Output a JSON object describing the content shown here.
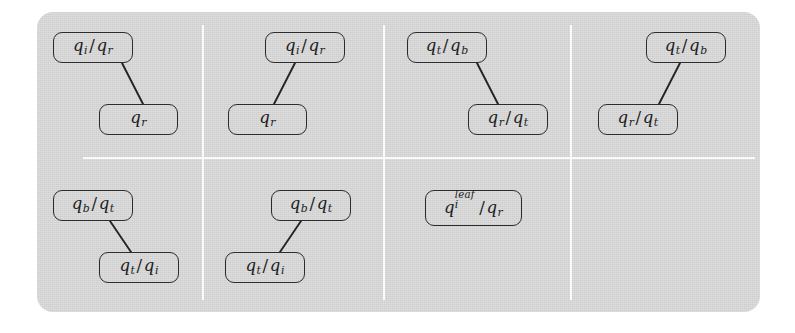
{
  "figure": {
    "panel": {
      "fill": "#d7d7d7",
      "divider_color": "#fbfbfb"
    },
    "page_background": "#ffffff",
    "ink_color": "#242424",
    "columns": 4,
    "rows": 2
  },
  "cells": [
    {
      "id": "cell-r1c1",
      "layout": "parent-left-child-right",
      "nodes": [
        {
          "id": "r1c1-parent",
          "label": "qi/qr",
          "role": "parent"
        },
        {
          "id": "r1c1-child",
          "label": "qr",
          "role": "child"
        }
      ],
      "edges": [
        {
          "from": "r1c1-parent",
          "to": "r1c1-child"
        }
      ]
    },
    {
      "id": "cell-r1c2",
      "layout": "parent-right-child-left",
      "nodes": [
        {
          "id": "r1c2-parent",
          "label": "qi/qr",
          "role": "parent"
        },
        {
          "id": "r1c2-child",
          "label": "qr",
          "role": "child"
        }
      ],
      "edges": [
        {
          "from": "r1c2-parent",
          "to": "r1c2-child"
        }
      ]
    },
    {
      "id": "cell-r1c3",
      "layout": "parent-left-child-right",
      "nodes": [
        {
          "id": "r1c3-parent",
          "label": "qt/qb",
          "role": "parent"
        },
        {
          "id": "r1c3-child",
          "label": "qr/qt",
          "role": "child"
        }
      ],
      "edges": [
        {
          "from": "r1c3-parent",
          "to": "r1c3-child"
        }
      ]
    },
    {
      "id": "cell-r1c4",
      "layout": "parent-right-child-left",
      "nodes": [
        {
          "id": "r1c4-parent",
          "label": "qt/qb",
          "role": "parent"
        },
        {
          "id": "r1c4-child",
          "label": "qr/qt",
          "role": "child"
        }
      ],
      "edges": [
        {
          "from": "r1c4-parent",
          "to": "r1c4-child"
        }
      ]
    },
    {
      "id": "cell-r2c1",
      "layout": "parent-left-child-right",
      "nodes": [
        {
          "id": "r2c1-parent",
          "label": "qb/qt",
          "role": "parent"
        },
        {
          "id": "r2c1-child",
          "label": "qt/qi",
          "role": "child"
        }
      ],
      "edges": [
        {
          "from": "r2c1-parent",
          "to": "r2c1-child"
        }
      ]
    },
    {
      "id": "cell-r2c2",
      "layout": "parent-right-child-left",
      "nodes": [
        {
          "id": "r2c2-parent",
          "label": "qb/qt",
          "role": "parent"
        },
        {
          "id": "r2c2-child",
          "label": "qt/qi",
          "role": "child"
        }
      ],
      "edges": [
        {
          "from": "r2c2-parent",
          "to": "r2c2-child"
        }
      ]
    },
    {
      "id": "cell-r2c3",
      "layout": "single-node",
      "nodes": [
        {
          "id": "r2c3-node",
          "label": "qi^leaf/qr",
          "role": "single"
        }
      ],
      "edges": []
    },
    {
      "id": "cell-r2c4",
      "layout": "empty",
      "nodes": [],
      "edges": []
    }
  ],
  "symbols": {
    "q": "q",
    "sub_i": "i",
    "sub_r": "r",
    "sub_t": "t",
    "sub_b": "b",
    "sup_leaf": "leaf",
    "slash": "/"
  }
}
